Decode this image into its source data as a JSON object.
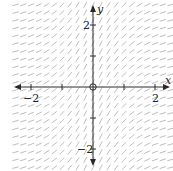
{
  "chart_data": {
    "type": "slope-field",
    "title": "",
    "xlabel": "x",
    "ylabel": "y",
    "xlim": [
      -2.5,
      2.5
    ],
    "ylim": [
      -2.6,
      2.7
    ],
    "x_ticks": [
      -2,
      -1,
      1,
      2
    ],
    "y_ticks": [
      -2,
      -1,
      1,
      2
    ],
    "x_tick_labels": [
      {
        "value": -2,
        "label": "−2"
      },
      {
        "value": 2,
        "label": "2"
      }
    ],
    "y_tick_labels": [
      {
        "value": 2,
        "label": "2"
      },
      {
        "value": -2,
        "label": "−2"
      }
    ],
    "grid": false,
    "slope_function": "dy/dx depends only on x; positive everywhere, steepest at x = 0, flattening as |x| grows (approx. 2/(1+x^2))",
    "sample_spacing": 0.25,
    "origin_marker": "open-circle",
    "colors": {
      "segments": "#b5b5b5",
      "axes": "#2a2a2a",
      "background": "#ffffff"
    }
  },
  "layout": {
    "origin_px": [
      93,
      87
    ],
    "unit_px": 31,
    "segment_len_px": 6.5
  }
}
